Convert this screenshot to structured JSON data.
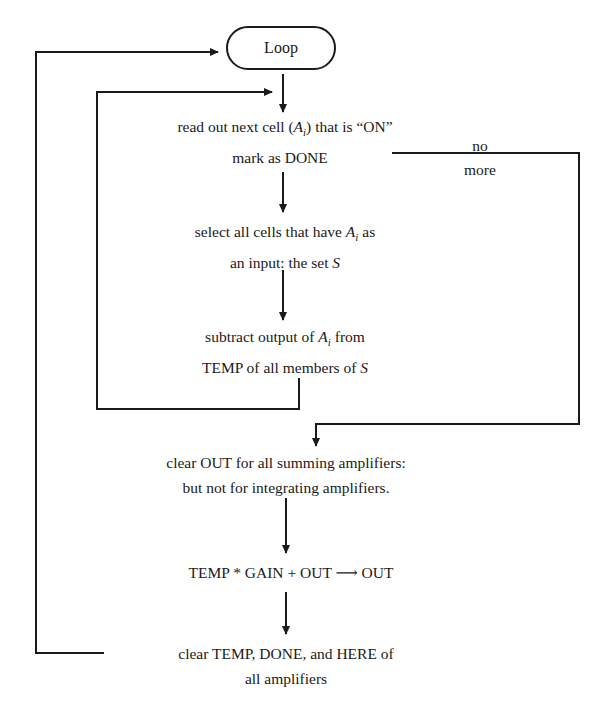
{
  "flowchart": {
    "start": {
      "label": "Loop"
    },
    "steps": [
      {
        "id": "read-out",
        "line1": "read out next cell (",
        "var": "A",
        "sub": "i",
        "line1_end": ") that is “ON”",
        "line2": "mark as DONE"
      },
      {
        "id": "select-cells",
        "line1_pre": "select all cells that have ",
        "var": "A",
        "sub": "i",
        "line1_end": " as",
        "line2_pre": "an input:  the set ",
        "line2_var": "S"
      },
      {
        "id": "subtract",
        "line1_pre": "subtract output of ",
        "var": "A",
        "sub": "i",
        "line1_end": " from",
        "line2_pre": "TEMP of all members of ",
        "line2_var": "S"
      },
      {
        "id": "clear-out",
        "line1": "clear OUT for all summing amplifiers:",
        "line2": "but not for integrating amplifiers."
      },
      {
        "id": "compute",
        "line1": "TEMP * GAIN + OUT ⟶ OUT"
      },
      {
        "id": "clear-temp",
        "line1": "clear TEMP, DONE, and HERE of",
        "line2": "all amplifiers"
      }
    ],
    "branch": {
      "label_top": "no",
      "label_bottom": "more"
    }
  }
}
